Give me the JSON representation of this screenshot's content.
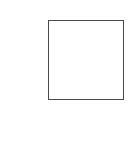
{
  "canvas": {
    "width_px": 134,
    "height_px": 144,
    "background_color": "#ffffff",
    "content_description": "",
    "text_content": ""
  },
  "shape": {
    "kind": "rectangle",
    "label": "",
    "x_px": 48,
    "y_px": 20,
    "width_px": 76,
    "height_px": 80,
    "border_color": "#4a4a4a",
    "border_width_px": 1,
    "fill_color": "#ffffff",
    "interior_label": ""
  },
  "regions": {
    "top_label": "",
    "left_label": "",
    "right_label": "",
    "bottom_label": ""
  }
}
